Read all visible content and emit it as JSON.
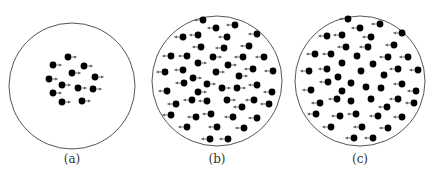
{
  "colors": {
    "circle": "#555555",
    "dot": "#000000",
    "arrow": "#666666"
  },
  "dot_radius": 3.4,
  "panels": [
    {
      "label": "(a)",
      "circle": {
        "cx": 72,
        "cy": 86,
        "r": 63
      },
      "label_pos": {
        "x": 72,
        "y": 163
      },
      "particles": [
        {
          "x": 68,
          "y": 57,
          "dir": "right"
        },
        {
          "x": 53,
          "y": 65,
          "dir": "right"
        },
        {
          "x": 84,
          "y": 66,
          "dir": "right"
        },
        {
          "x": 72,
          "y": 73,
          "dir": "right"
        },
        {
          "x": 95,
          "y": 77,
          "dir": "right"
        },
        {
          "x": 49,
          "y": 79,
          "dir": "right"
        },
        {
          "x": 62,
          "y": 85,
          "dir": "right"
        },
        {
          "x": 78,
          "y": 88,
          "dir": "right"
        },
        {
          "x": 93,
          "y": 89,
          "dir": "right"
        },
        {
          "x": 53,
          "y": 93,
          "dir": "right"
        },
        {
          "x": 62,
          "y": 102,
          "dir": "right"
        },
        {
          "x": 82,
          "y": 101,
          "dir": "right"
        }
      ]
    },
    {
      "label": "(b)",
      "circle": {
        "cx": 217,
        "cy": 81,
        "r": 65
      },
      "label_pos": {
        "x": 217,
        "y": 163
      },
      "particles": [
        {
          "x": 203,
          "y": 20,
          "dir": "left"
        },
        {
          "x": 216,
          "y": 28,
          "dir": "left"
        },
        {
          "x": 235,
          "y": 25,
          "dir": "left"
        },
        {
          "x": 183,
          "y": 37,
          "dir": "left"
        },
        {
          "x": 198,
          "y": 35,
          "dir": "left"
        },
        {
          "x": 227,
          "y": 37,
          "dir": "left"
        },
        {
          "x": 257,
          "y": 34,
          "dir": "left"
        },
        {
          "x": 201,
          "y": 47,
          "dir": "left"
        },
        {
          "x": 224,
          "y": 48,
          "dir": "left"
        },
        {
          "x": 249,
          "y": 46,
          "dir": "left"
        },
        {
          "x": 171,
          "y": 56,
          "dir": "left"
        },
        {
          "x": 187,
          "y": 56,
          "dir": "left"
        },
        {
          "x": 213,
          "y": 57,
          "dir": "right"
        },
        {
          "x": 243,
          "y": 57,
          "dir": "left"
        },
        {
          "x": 264,
          "y": 57,
          "dir": "left"
        },
        {
          "x": 198,
          "y": 63,
          "dir": "right"
        },
        {
          "x": 228,
          "y": 65,
          "dir": "right"
        },
        {
          "x": 165,
          "y": 72,
          "dir": "left"
        },
        {
          "x": 183,
          "y": 70,
          "dir": "left"
        },
        {
          "x": 216,
          "y": 72,
          "dir": "right"
        },
        {
          "x": 253,
          "y": 69,
          "dir": "left"
        },
        {
          "x": 273,
          "y": 71,
          "dir": "left"
        },
        {
          "x": 239,
          "y": 76,
          "dir": "right"
        },
        {
          "x": 193,
          "y": 78,
          "dir": "right"
        },
        {
          "x": 184,
          "y": 83,
          "dir": "left"
        },
        {
          "x": 207,
          "y": 84,
          "dir": "right"
        },
        {
          "x": 257,
          "y": 85,
          "dir": "left"
        },
        {
          "x": 167,
          "y": 91,
          "dir": "left"
        },
        {
          "x": 198,
          "y": 92,
          "dir": "right"
        },
        {
          "x": 222,
          "y": 88,
          "dir": "right"
        },
        {
          "x": 237,
          "y": 88,
          "dir": "right"
        },
        {
          "x": 272,
          "y": 92,
          "dir": "left"
        },
        {
          "x": 192,
          "y": 100,
          "dir": "left"
        },
        {
          "x": 207,
          "y": 101,
          "dir": "left"
        },
        {
          "x": 227,
          "y": 100,
          "dir": "right"
        },
        {
          "x": 254,
          "y": 100,
          "dir": "left"
        },
        {
          "x": 176,
          "y": 104,
          "dir": "left"
        },
        {
          "x": 242,
          "y": 107,
          "dir": "left"
        },
        {
          "x": 269,
          "y": 104,
          "dir": "left"
        },
        {
          "x": 171,
          "y": 115,
          "dir": "left"
        },
        {
          "x": 196,
          "y": 117,
          "dir": "left"
        },
        {
          "x": 211,
          "y": 114,
          "dir": "left"
        },
        {
          "x": 233,
          "y": 117,
          "dir": "left"
        },
        {
          "x": 257,
          "y": 118,
          "dir": "left"
        },
        {
          "x": 187,
          "y": 127,
          "dir": "left"
        },
        {
          "x": 217,
          "y": 127,
          "dir": "left"
        },
        {
          "x": 244,
          "y": 128,
          "dir": "left"
        },
        {
          "x": 210,
          "y": 139,
          "dir": "left"
        },
        {
          "x": 228,
          "y": 139,
          "dir": "left"
        }
      ]
    },
    {
      "label": "(c)",
      "circle": {
        "cx": 360,
        "cy": 81,
        "r": 65
      },
      "label_pos": {
        "x": 360,
        "y": 163
      },
      "particles": [
        {
          "x": 348,
          "y": 19,
          "dir": "left"
        },
        {
          "x": 360,
          "y": 28,
          "dir": "left"
        },
        {
          "x": 380,
          "y": 24,
          "dir": "left"
        },
        {
          "x": 327,
          "y": 36,
          "dir": "left"
        },
        {
          "x": 342,
          "y": 35,
          "dir": "left"
        },
        {
          "x": 371,
          "y": 37,
          "dir": "left"
        },
        {
          "x": 402,
          "y": 33,
          "dir": "left"
        },
        {
          "x": 346,
          "y": 47,
          "dir": "left"
        },
        {
          "x": 368,
          "y": 47,
          "dir": "left"
        },
        {
          "x": 394,
          "y": 45,
          "dir": "left"
        },
        {
          "x": 315,
          "y": 54,
          "dir": "left"
        },
        {
          "x": 331,
          "y": 54,
          "dir": "left"
        },
        {
          "x": 357,
          "y": 56,
          "dir": "none"
        },
        {
          "x": 388,
          "y": 57,
          "dir": "left"
        },
        {
          "x": 408,
          "y": 57,
          "dir": "left"
        },
        {
          "x": 342,
          "y": 63,
          "dir": "none"
        },
        {
          "x": 373,
          "y": 64,
          "dir": "none"
        },
        {
          "x": 309,
          "y": 71,
          "dir": "left"
        },
        {
          "x": 327,
          "y": 69,
          "dir": "left"
        },
        {
          "x": 361,
          "y": 71,
          "dir": "none"
        },
        {
          "x": 398,
          "y": 69,
          "dir": "left"
        },
        {
          "x": 418,
          "y": 70,
          "dir": "left"
        },
        {
          "x": 384,
          "y": 75,
          "dir": "none"
        },
        {
          "x": 338,
          "y": 77,
          "dir": "none"
        },
        {
          "x": 328,
          "y": 82,
          "dir": "left"
        },
        {
          "x": 351,
          "y": 83,
          "dir": "none"
        },
        {
          "x": 402,
          "y": 84,
          "dir": "left"
        },
        {
          "x": 311,
          "y": 90,
          "dir": "left"
        },
        {
          "x": 342,
          "y": 91,
          "dir": "none"
        },
        {
          "x": 366,
          "y": 87,
          "dir": "none"
        },
        {
          "x": 381,
          "y": 88,
          "dir": "none"
        },
        {
          "x": 416,
          "y": 91,
          "dir": "left"
        },
        {
          "x": 337,
          "y": 99,
          "dir": "left"
        },
        {
          "x": 351,
          "y": 101,
          "dir": "none"
        },
        {
          "x": 371,
          "y": 99,
          "dir": "none"
        },
        {
          "x": 398,
          "y": 99,
          "dir": "left"
        },
        {
          "x": 320,
          "y": 103,
          "dir": "left"
        },
        {
          "x": 387,
          "y": 107,
          "dir": "left"
        },
        {
          "x": 414,
          "y": 103,
          "dir": "left"
        },
        {
          "x": 316,
          "y": 114,
          "dir": "left"
        },
        {
          "x": 340,
          "y": 116,
          "dir": "left"
        },
        {
          "x": 356,
          "y": 114,
          "dir": "left"
        },
        {
          "x": 378,
          "y": 116,
          "dir": "left"
        },
        {
          "x": 402,
          "y": 117,
          "dir": "left"
        },
        {
          "x": 331,
          "y": 127,
          "dir": "left"
        },
        {
          "x": 362,
          "y": 127,
          "dir": "left"
        },
        {
          "x": 388,
          "y": 128,
          "dir": "left"
        },
        {
          "x": 354,
          "y": 138,
          "dir": "left"
        },
        {
          "x": 373,
          "y": 138,
          "dir": "left"
        }
      ]
    }
  ]
}
